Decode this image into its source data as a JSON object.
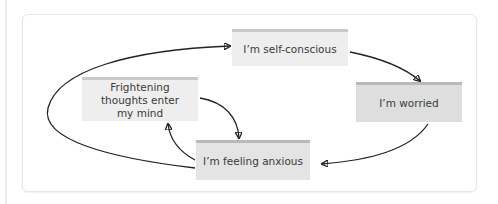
{
  "diagram": {
    "type": "cycle-flow",
    "nodes": [
      {
        "id": "self",
        "label": "I’m self-conscious"
      },
      {
        "id": "worried",
        "label": "I’m worried"
      },
      {
        "id": "anxious",
        "label": "I’m feeling anxious"
      },
      {
        "id": "fright",
        "label": "Frightening thoughts enter my mind"
      }
    ],
    "edges": [
      {
        "from": "self",
        "to": "worried"
      },
      {
        "from": "worried",
        "to": "anxious"
      },
      {
        "from": "anxious",
        "to": "fright"
      },
      {
        "from": "fright",
        "to": "anxious"
      },
      {
        "from": "anxious",
        "to": "self"
      }
    ],
    "colors": {
      "node_fill": "#e4e4e4",
      "node_top_border": "#b9b9b9",
      "arrow": "#222222"
    }
  }
}
